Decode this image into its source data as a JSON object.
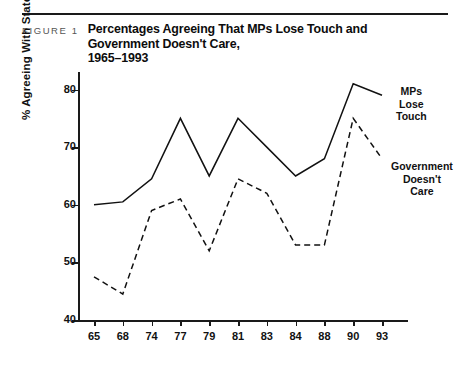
{
  "figure": {
    "label": "FIGURE 1",
    "title_line1": "Percentages Agreeing That MPs Lose Touch and Government Doesn't Care,",
    "title_line2": "1965–1993"
  },
  "chart_data": {
    "type": "line",
    "title": "Percentages Agreeing That MPs Lose Touch and Government Doesn't Care, 1965–1993",
    "xlabel": "",
    "ylabel": "% Agreeing With Statement",
    "categories": [
      "65",
      "68",
      "74",
      "77",
      "79",
      "81",
      "83",
      "84",
      "88",
      "90",
      "93"
    ],
    "xtick_labels": [
      "65",
      "68",
      "74",
      "77",
      "79",
      "81",
      "83",
      "84",
      "88",
      "90",
      "93"
    ],
    "ytick_labels": [
      "40",
      "50",
      "60",
      "70",
      "80"
    ],
    "yticks": [
      40,
      50,
      60,
      70,
      80
    ],
    "ylim": [
      40,
      82
    ],
    "grid": false,
    "legend_position": "inline-annotations",
    "series": [
      {
        "name": "MPs Lose Touch",
        "style": "solid",
        "color": "#111111",
        "annotation": [
          "MPs",
          "Lose",
          "Touch"
        ],
        "values": [
          60,
          60.5,
          64.5,
          75,
          65,
          75,
          70,
          65,
          68,
          81,
          79
        ]
      },
      {
        "name": "Government Doesn't Care",
        "style": "dashed",
        "color": "#111111",
        "annotation": [
          "Government",
          "Doesn't",
          "Care"
        ],
        "values": [
          47.5,
          44.5,
          59,
          61,
          52,
          64.5,
          62,
          53,
          53,
          75,
          68
        ]
      }
    ]
  }
}
